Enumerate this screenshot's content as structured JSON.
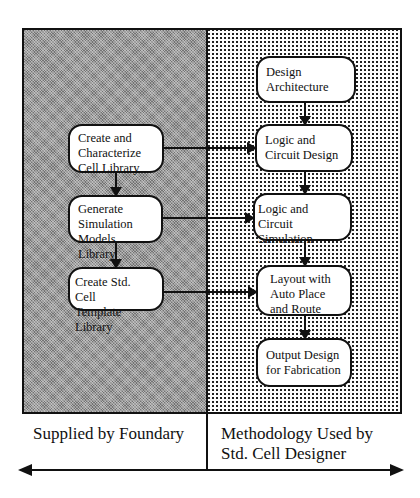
{
  "diagram": {
    "type": "flowchart",
    "left_region": {
      "label": "Supplied by Foundary",
      "fill": "gray-crosshatch",
      "steps": [
        {
          "id": "create-characterize",
          "label": "Create and\nCharacterize\nCell Library"
        },
        {
          "id": "generate-simulation",
          "label": "Generate\nSimulation\nModels Library"
        },
        {
          "id": "create-template",
          "label": "Create Std. Cell\nTemplate Library"
        }
      ]
    },
    "right_region": {
      "label": "Methodology Used by\nStd. Cell Designer",
      "fill": "dotted",
      "steps": [
        {
          "id": "design-architecture",
          "label": "Design\nArchitecture"
        },
        {
          "id": "logic-circuit-design",
          "label": "Logic and\nCircuit Design"
        },
        {
          "id": "logic-circuit-simulation",
          "label": "Logic and Circuit\nSimulation"
        },
        {
          "id": "layout-auto-place",
          "label": "Layout with\nAuto Place\nand Route"
        },
        {
          "id": "output-design",
          "label": "Output Design\nfor Fabrication"
        }
      ]
    },
    "edges": [
      {
        "from": "create-characterize",
        "to": "generate-simulation"
      },
      {
        "from": "generate-simulation",
        "to": "create-template"
      },
      {
        "from": "design-architecture",
        "to": "logic-circuit-design"
      },
      {
        "from": "logic-circuit-design",
        "to": "logic-circuit-simulation"
      },
      {
        "from": "logic-circuit-simulation",
        "to": "layout-auto-place"
      },
      {
        "from": "layout-auto-place",
        "to": "output-design"
      },
      {
        "from": "create-characterize",
        "to": "logic-circuit-design"
      },
      {
        "from": "generate-simulation",
        "to": "logic-circuit-simulation"
      },
      {
        "from": "create-template",
        "to": "layout-auto-place"
      }
    ],
    "bottom_axis": "double-headed arrow"
  }
}
